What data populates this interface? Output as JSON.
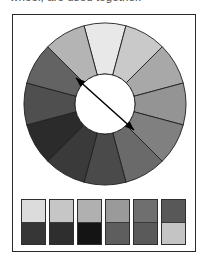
{
  "caption": {
    "text": "wheel, are used together."
  },
  "figure": {
    "label": "grayscale-color-wheel-figure",
    "frame_border_color": "#2b2b2b",
    "background_color": "#ffffff"
  },
  "color_wheel": {
    "name": "twelve-segment-color-wheel",
    "segment_count": 12,
    "outer_radius": 81,
    "inner_radius": 30,
    "hub_color": "#ffffff",
    "segment_stroke_color": "#1f1f1f",
    "segments": [
      {
        "index": 0,
        "position": "top",
        "angle_start": -105,
        "angle_end": -75,
        "fill": "#e8e8e8"
      },
      {
        "index": 1,
        "position": "top-right",
        "angle_start": -75,
        "angle_end": -45,
        "fill": "#c9c9c9"
      },
      {
        "index": 2,
        "position": "upper-right",
        "angle_start": -45,
        "angle_end": -15,
        "fill": "#a8a8a8"
      },
      {
        "index": 3,
        "position": "right",
        "angle_start": -15,
        "angle_end": 15,
        "fill": "#949494"
      },
      {
        "index": 4,
        "position": "lower-right",
        "angle_start": 15,
        "angle_end": 45,
        "fill": "#808080"
      },
      {
        "index": 5,
        "position": "bottom-right",
        "angle_start": 45,
        "angle_end": 75,
        "fill": "#6a6a6a"
      },
      {
        "index": 6,
        "position": "bottom",
        "angle_start": 75,
        "angle_end": 105,
        "fill": "#4a4a4a"
      },
      {
        "index": 7,
        "position": "bottom-left",
        "angle_start": 105,
        "angle_end": 135,
        "fill": "#3a3a3a"
      },
      {
        "index": 8,
        "position": "lower-left",
        "angle_start": 135,
        "angle_end": 165,
        "fill": "#2b2b2b"
      },
      {
        "index": 9,
        "position": "left",
        "angle_start": 165,
        "angle_end": 195,
        "fill": "#4f4f4f"
      },
      {
        "index": 10,
        "position": "upper-left",
        "angle_start": 195,
        "angle_end": 225,
        "fill": "#636363"
      },
      {
        "index": 11,
        "position": "top-left",
        "angle_start": 225,
        "angle_end": 255,
        "fill": "#b4b4b4"
      }
    ],
    "arrow": {
      "name": "complementary-pair-arrow",
      "style": "double-headed",
      "color": "#000000",
      "from_x": 24,
      "from_y": 27,
      "to_x": 58,
      "to_y": 53
    }
  },
  "swatches": {
    "name": "contrast-pair-swatches",
    "count": 6,
    "pairs": [
      {
        "index": 0,
        "top": "#dcdcdc",
        "bottom": "#363636",
        "contrast": "high"
      },
      {
        "index": 1,
        "top": "#c6c6c6",
        "bottom": "#2e2e2e",
        "contrast": "high"
      },
      {
        "index": 2,
        "top": "#b0b0b0",
        "bottom": "#141414",
        "contrast": "high"
      },
      {
        "index": 3,
        "top": "#9a9a9a",
        "bottom": "#5e5e5e",
        "contrast": "medium"
      },
      {
        "index": 4,
        "top": "#6f6f6f",
        "bottom": "#5a5a5a",
        "contrast": "low"
      },
      {
        "index": 5,
        "top": "#585858",
        "bottom": "#c4c4c4",
        "contrast": "inverted"
      }
    ]
  }
}
